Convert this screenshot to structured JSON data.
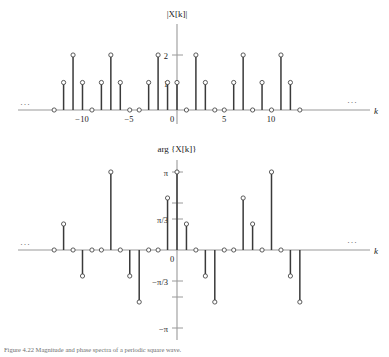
{
  "figure": {
    "caption": "Figure 4.22  Magnitude and phase spectra of a periodic square wave.",
    "axis_label_k": "k",
    "ellipsis": "···"
  },
  "magnitude_plot": {
    "title": "|X[k]|",
    "y_ticks": [
      {
        "value": 2,
        "label": "2"
      },
      {
        "value": 1,
        "label": "1"
      }
    ],
    "x_ticks": [
      {
        "value": -10,
        "label": "−10"
      },
      {
        "value": -5,
        "label": "−5"
      },
      {
        "value": 0,
        "label": "0"
      },
      {
        "value": 5,
        "label": "5"
      },
      {
        "value": 10,
        "label": "10"
      }
    ]
  },
  "phase_plot": {
    "title": "arg {X[k]}",
    "y_ticks": [
      {
        "value": 3.1416,
        "label": "π"
      },
      {
        "value": 1.5708,
        "label": ""
      },
      {
        "value": 1.0472,
        "label": "π/3"
      },
      {
        "value": 0,
        "label": "0"
      },
      {
        "value": -1.0472,
        "label": "−π/3"
      },
      {
        "value": -1.5708,
        "label": ""
      },
      {
        "value": -3.1416,
        "label": "−π"
      }
    ]
  },
  "chart_data": [
    {
      "type": "stem",
      "name": "magnitude-spectrum",
      "title": "|X[k]|",
      "xlabel": "k",
      "ylabel": "|X[k]|",
      "xlim": [
        -13,
        13
      ],
      "ylim": [
        0,
        2.4
      ],
      "grid": false,
      "legend": null,
      "x": [
        -13,
        -12,
        -11,
        -10,
        -9,
        -8,
        -7,
        -6,
        -5,
        -4,
        -3,
        -2,
        -1,
        0,
        1,
        2,
        3,
        4,
        5,
        6,
        7,
        8,
        9,
        10,
        11,
        12,
        13
      ],
      "values": [
        0,
        1,
        2,
        1,
        0,
        1,
        2,
        1,
        0,
        0,
        1,
        2,
        1,
        1,
        0,
        2,
        1,
        0,
        0,
        1,
        2,
        0,
        1,
        0,
        2,
        1,
        0
      ]
    },
    {
      "type": "stem",
      "name": "phase-spectrum",
      "title": "arg {X[k]}",
      "xlabel": "k",
      "ylabel": "arg {X[k]}",
      "xlim": [
        -13,
        13
      ],
      "ylim": [
        -3.1416,
        3.1416
      ],
      "grid": false,
      "legend": null,
      "x": [
        -13,
        -12,
        -11,
        -10,
        -9,
        -8,
        -7,
        -6,
        -5,
        -4,
        -3,
        -2,
        -1,
        0,
        1,
        2,
        3,
        4,
        5,
        6,
        7,
        8,
        9,
        10,
        11,
        12,
        13
      ],
      "values": [
        0,
        1.0472,
        0,
        -1.0472,
        0,
        0,
        3.1416,
        0,
        -1.0472,
        -2.0944,
        0,
        0,
        2.0944,
        3.1416,
        1.0472,
        0,
        -1.0472,
        -2.0944,
        0,
        0,
        2.0944,
        1.0472,
        0,
        3.1416,
        0,
        -1.0472,
        -2.0944
      ]
    }
  ]
}
